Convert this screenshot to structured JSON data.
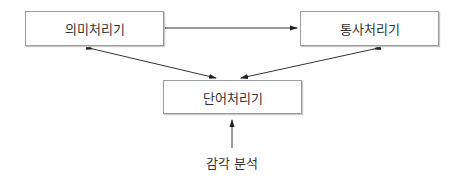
{
  "diagram": {
    "nodes": {
      "semantic": "의미처리기",
      "syntax": "통사처리기",
      "word": "단어처리기"
    },
    "input_label": "감각 분석",
    "edges": [
      {
        "from": "semantic",
        "to": "syntax",
        "direction": "bidirectional"
      },
      {
        "from": "semantic",
        "to": "word",
        "direction": "bidirectional"
      },
      {
        "from": "syntax",
        "to": "word",
        "direction": "bidirectional"
      },
      {
        "from": "input",
        "to": "word",
        "direction": "one-way"
      }
    ]
  }
}
